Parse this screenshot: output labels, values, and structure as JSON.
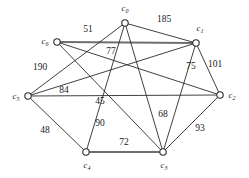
{
  "figure": {
    "type": "weighted-undirected-graph",
    "background_color": "#ffffff",
    "edge_color": "#2b2b2b",
    "highlight_edge_color": "#6e6e6e",
    "node_fill": "#ffffff"
  },
  "nodes": [
    {
      "id": "c0",
      "base": "c",
      "sub": "0",
      "x": 125,
      "y": 23,
      "label_x": 125,
      "label_y": 11
    },
    {
      "id": "c1",
      "base": "c",
      "sub": "1",
      "x": 196,
      "y": 43,
      "label_x": 200,
      "label_y": 31
    },
    {
      "id": "c2",
      "base": "c",
      "sub": "2",
      "x": 220,
      "y": 95,
      "label_x": 232,
      "label_y": 98
    },
    {
      "id": "c3",
      "base": "c",
      "sub": "3",
      "x": 163,
      "y": 152,
      "label_x": 164,
      "label_y": 168
    },
    {
      "id": "c4",
      "base": "c",
      "sub": "4",
      "x": 86,
      "y": 152,
      "label_x": 87,
      "label_y": 168
    },
    {
      "id": "c5",
      "base": "c",
      "sub": "5",
      "x": 28,
      "y": 96,
      "label_x": 16,
      "label_y": 99
    },
    {
      "id": "c6",
      "base": "c",
      "sub": "6",
      "x": 57,
      "y": 42,
      "label_x": 45,
      "label_y": 44
    }
  ],
  "edges": [
    {
      "from": "c6",
      "to": "c1",
      "weight": "51",
      "style": "thick",
      "label_x": 88,
      "label_y": 32
    },
    {
      "from": "c0",
      "to": "c1",
      "weight": "185",
      "style": "thin",
      "label_x": 164,
      "label_y": 22
    },
    {
      "from": "c6",
      "to": "c2",
      "weight": "77",
      "style": "thin",
      "label_x": 111,
      "label_y": 54
    },
    {
      "from": "c1",
      "to": "c2",
      "weight": "101",
      "style": "thin",
      "label_x": 215,
      "label_y": 67
    },
    {
      "from": "c1",
      "to": "c3",
      "weight": "75",
      "style": "thin",
      "label_x": 191,
      "label_y": 69
    },
    {
      "from": "c5",
      "to": "c1",
      "weight": "190",
      "style": "thin",
      "label_x": 40,
      "label_y": 70
    },
    {
      "from": "c5",
      "to": "c0",
      "weight": "84",
      "style": "thin",
      "label_x": 64,
      "label_y": 93
    },
    {
      "from": "c6",
      "to": "c3",
      "weight": "45",
      "style": "thin",
      "label_x": 100,
      "label_y": 104
    },
    {
      "from": "c4",
      "to": "c0",
      "weight": "90",
      "style": "thin",
      "label_x": 100,
      "label_y": 126
    },
    {
      "from": "c0",
      "to": "c3",
      "weight": "68",
      "style": "thin",
      "label_x": 163,
      "label_y": 117
    },
    {
      "from": "c5",
      "to": "c4",
      "weight": "48",
      "style": "thin",
      "label_x": 45,
      "label_y": 133
    },
    {
      "from": "c4",
      "to": "c3",
      "weight": "72",
      "style": "thick",
      "label_x": 124,
      "label_y": 145
    },
    {
      "from": "c2",
      "to": "c3",
      "weight": "93",
      "style": "thin",
      "label_x": 200,
      "label_y": 131
    },
    {
      "from": "c5",
      "to": "c2",
      "weight": "",
      "style": "thin",
      "label_x": 0,
      "label_y": 0
    }
  ]
}
